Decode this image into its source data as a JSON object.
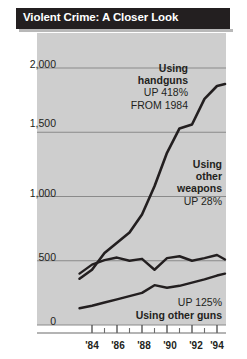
{
  "header": {
    "title": "Violent Crime: A Closer Look"
  },
  "colors": {
    "header_bg": "#231f20",
    "plot_bg": "#cecece",
    "line": "#231f20",
    "gridline": "#8a8a8a",
    "text": "#231f20",
    "title_text": "#ffffff"
  },
  "annotations": {
    "handguns": {
      "line1": "Using",
      "line2": "handguns",
      "line3": "UP 418%",
      "line4": "FROM 1984"
    },
    "other_weapons": {
      "line1": "Using",
      "line2": "other",
      "line3": "weapons",
      "line4": "UP 28%"
    },
    "other_guns": {
      "line1": "UP 125%",
      "line2": "Using other guns"
    }
  },
  "chart_data": {
    "type": "line",
    "title": "Violent Crime: A Closer Look",
    "xlabel": "",
    "ylabel": "",
    "xlim": [
      1983,
      1995
    ],
    "ylim": [
      0,
      2100
    ],
    "grid": true,
    "grid_axis": "y",
    "legend_position": "inline-annotations",
    "ytick_labels": [
      "2,000",
      "1,500",
      "1,000",
      "500",
      "0"
    ],
    "ytick_values": [
      2000,
      1500,
      1000,
      500,
      0
    ],
    "xtick_labels": [
      "'84",
      "'86",
      "'88",
      "'90",
      "'92",
      "'94"
    ],
    "xtick_values": [
      1984,
      1986,
      1988,
      1990,
      1992,
      1994
    ],
    "xtick_minor_values": [
      1985,
      1987,
      1989,
      1991,
      1993
    ],
    "x": [
      1983,
      1984,
      1985,
      1986,
      1987,
      1988,
      1989,
      1990,
      1991,
      1992,
      1993,
      1994,
      1995
    ],
    "series": [
      {
        "name": "Using handguns",
        "annotation": "Using handguns UP 418% FROM 1984",
        "change_percent": 418,
        "values": [
          360,
          430,
          560,
          640,
          720,
          860,
          1080,
          1340,
          1530,
          1560,
          1760,
          1860,
          1875
        ]
      },
      {
        "name": "Using other weapons",
        "annotation": "Using other weapons UP 28%",
        "change_percent": 28,
        "values": [
          400,
          470,
          505,
          525,
          500,
          515,
          430,
          520,
          535,
          500,
          520,
          545,
          510
        ]
      },
      {
        "name": "Using other guns",
        "annotation": "Using other guns UP 125%",
        "change_percent": 125,
        "values": [
          130,
          150,
          175,
          200,
          225,
          250,
          310,
          290,
          305,
          330,
          355,
          385,
          400
        ]
      }
    ]
  }
}
